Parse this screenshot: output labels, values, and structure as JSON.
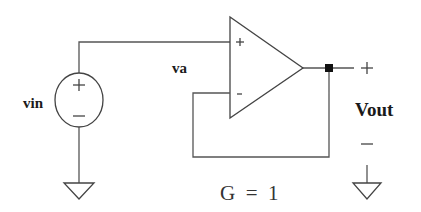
{
  "diagram": {
    "type": "circuit-schematic",
    "labels": {
      "source": "vin",
      "node": "va",
      "output": "Vout",
      "gain": "G = 1",
      "opamp_plus": "+",
      "opamp_minus": "-",
      "source_plus": "+",
      "source_minus": "—",
      "out_plus": "+",
      "out_minus": "—"
    },
    "components": [
      {
        "id": "vin",
        "kind": "voltage-source",
        "label": "vin"
      },
      {
        "id": "opamp",
        "kind": "op-amp",
        "inputs": [
          "+",
          "-"
        ]
      },
      {
        "id": "gnd_left",
        "kind": "ground"
      },
      {
        "id": "gnd_right",
        "kind": "ground"
      },
      {
        "id": "out_node",
        "kind": "junction-node"
      }
    ],
    "connections": [
      [
        "vin.+",
        "opamp.+"
      ],
      [
        "vin.-",
        "gnd_left"
      ],
      [
        "opamp.out",
        "out_node"
      ],
      [
        "out_node",
        "opamp.-"
      ],
      [
        "out_node",
        "Vout.+"
      ],
      [
        "Vout.-",
        "gnd_right"
      ]
    ],
    "colors": {
      "wire": "#555555",
      "symbol": "#444444",
      "text": "#1a1a1a",
      "node": "#111111",
      "background": "#ffffff"
    }
  }
}
